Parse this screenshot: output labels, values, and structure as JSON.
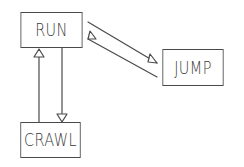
{
  "diagram": {
    "type": "state-diagram",
    "style": "hand-drawn",
    "colors": {
      "stroke": "#4a4a4a",
      "text": "#3a3a3a",
      "background": "#ffffff"
    },
    "nodes": [
      {
        "id": "run",
        "label": "RUN",
        "x": 15,
        "y": 12,
        "w": 73,
        "h": 36
      },
      {
        "id": "jump",
        "label": "JUMP",
        "x": 157,
        "y": 49,
        "w": 72,
        "h": 37
      },
      {
        "id": "crawl",
        "label": "CRAWL",
        "x": 15,
        "y": 122,
        "w": 71,
        "h": 36
      }
    ],
    "edges": [
      {
        "from": "RUN",
        "to": "JUMP",
        "arrow": "hollow-triangle"
      },
      {
        "from": "JUMP",
        "to": "RUN",
        "arrow": "hollow-triangle"
      },
      {
        "from": "CRAWL",
        "to": "RUN",
        "arrow": "hollow-triangle"
      },
      {
        "from": "RUN",
        "to": "CRAWL",
        "arrow": "hollow-triangle"
      }
    ]
  }
}
